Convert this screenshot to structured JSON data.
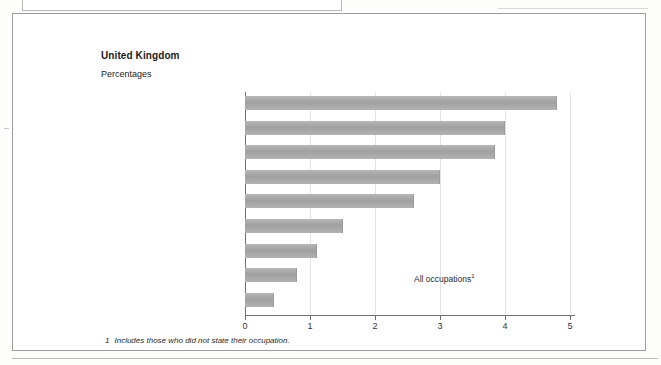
{
  "document": {
    "title": "United Kingdom",
    "subtitle": "Percentages",
    "footnote_marker": "1",
    "footnote_text": "Includes those who did not state their occupation.",
    "annotation": "All occupations",
    "annotation_marker": "1"
  },
  "colors": {
    "bar_fill": "#a9a9a9",
    "axis": "#6e6e6e",
    "gridline": "#e3e3e3",
    "frame": "#9d9d9d",
    "text": "#1a1a1a",
    "page_background": "#fdfdfc"
  },
  "chart_data": {
    "type": "bar",
    "orientation": "horizontal",
    "title": "United Kingdom",
    "subtitle": "Percentages",
    "xlabel": "",
    "ylabel": "",
    "xlim": [
      0,
      5
    ],
    "xticks": [
      "0",
      "1",
      "2",
      "3",
      "4",
      "5"
    ],
    "grid": true,
    "grid_axis": "x",
    "legend": "none",
    "categories": [
      "Associate professional\nand technical",
      "Managers and administrators",
      "Clerical and secretarial",
      "Personal and\nprotective services",
      "Professional",
      "Craft and related",
      "Sales",
      "Plant and machine operatives",
      "Other"
    ],
    "values": [
      4.8,
      4.0,
      3.85,
      3.0,
      2.6,
      1.5,
      1.1,
      0.8,
      0.45
    ],
    "annotations": [
      {
        "text": "All occupations",
        "marker": "1",
        "x": 2.6,
        "y": "Plant and machine operatives"
      }
    ]
  }
}
